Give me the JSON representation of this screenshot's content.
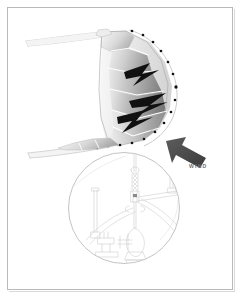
{
  "figure": {
    "kind": "technical-illustration",
    "background_color": "#ffffff",
    "frame_color": "#b9b9b9"
  },
  "annotations": {
    "wind_label": "WIND"
  },
  "sail": {
    "name": "curved-sail-body",
    "panel_fill_light": "#e2e2e2",
    "panel_fill_mid": "#a8a8a8",
    "panel_fill_dark": "#6b6b6b",
    "accent_shape_color": "#111111",
    "outline_color": "#9a9a9a",
    "seam_color": "#ffffff",
    "attachment_point_color": "#111111",
    "attachment_point_count": 16,
    "zigzag_count": 3
  },
  "spars": {
    "name": "upper-and-lower-spars",
    "line_color": "#cfcfcf",
    "count": 4
  },
  "wind_arrow": {
    "name": "wind-direction-arrow",
    "fill": "#4a4a4a",
    "direction": "up-left"
  },
  "detail_inset": {
    "name": "magnified-rigging-detail",
    "shape": "circle",
    "center_x": 124,
    "center_y": 208,
    "radius": 56,
    "border_color": "#b0b0b0",
    "line_color": "#cccccc",
    "contents": "halyard, shackle, turnbuckle, clew fittings and deck hardware line art"
  }
}
